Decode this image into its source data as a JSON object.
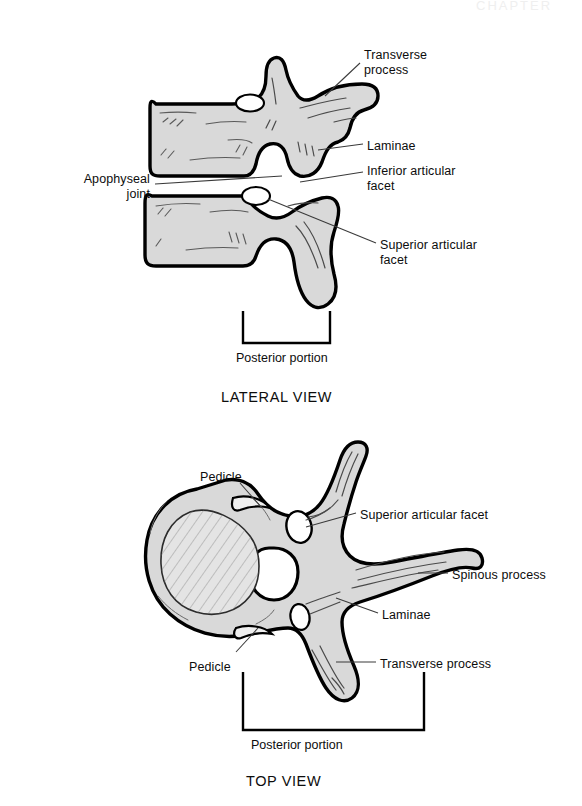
{
  "page": {
    "width": 582,
    "height": 806,
    "background": "#ffffff",
    "header_partial_text": "CHAPTER"
  },
  "figure": {
    "bone_fill_color": "#d9d9d9",
    "outline_color": "#000000",
    "leader_line_color": "#3a3a3a"
  },
  "views": [
    {
      "id": "lateral",
      "caption": "LATERAL VIEW",
      "caption_x": 221,
      "caption_y": 389,
      "bracket_label": "Posterior portion",
      "bracket_label_x": 236,
      "bracket_label_y": 351,
      "labels": [
        {
          "key": "transverse-process",
          "text": "Transverse\nprocess",
          "x": 364,
          "y": 48,
          "align": "left"
        },
        {
          "key": "laminae",
          "text": "Laminae",
          "x": 367,
          "y": 139,
          "align": "left"
        },
        {
          "key": "inferior-articular-facet",
          "text": "Inferior articular\nfacet",
          "x": 367,
          "y": 164,
          "align": "left"
        },
        {
          "key": "superior-articular-facet",
          "text": "Superior articular\nfacet",
          "x": 380,
          "y": 238,
          "align": "left"
        },
        {
          "key": "apophyseal-joint",
          "text": "Apophyseal\njoint",
          "x": 30,
          "y": 172,
          "align": "right",
          "width": 120
        }
      ]
    },
    {
      "id": "top",
      "caption": "TOP VIEW",
      "caption_x": 246,
      "caption_y": 773,
      "bracket_label": "Posterior portion",
      "bracket_label_x": 251,
      "bracket_label_y": 738,
      "labels": [
        {
          "key": "pedicle-upper",
          "text": "Pedicle",
          "x": 200,
          "y": 470,
          "align": "left"
        },
        {
          "key": "superior-articular-facet",
          "text": "Superior articular facet",
          "x": 360,
          "y": 508,
          "align": "left"
        },
        {
          "key": "spinous-process",
          "text": "Spinous process",
          "x": 452,
          "y": 568,
          "align": "left"
        },
        {
          "key": "laminae",
          "text": "Laminae",
          "x": 382,
          "y": 608,
          "align": "left"
        },
        {
          "key": "pedicle-lower",
          "text": "Pedicle",
          "x": 189,
          "y": 660,
          "align": "left"
        },
        {
          "key": "transverse-process",
          "text": "Transverse process",
          "x": 380,
          "y": 657,
          "align": "left"
        }
      ]
    }
  ]
}
